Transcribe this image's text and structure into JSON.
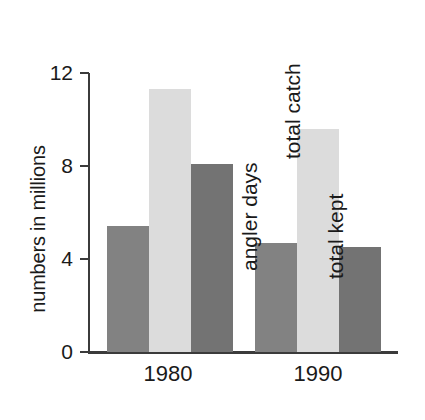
{
  "chart_data": {
    "type": "bar",
    "title": "",
    "subtitle": "",
    "xlabel": "",
    "ylabel": "numbers in millions",
    "categories": [
      "1980",
      "1990"
    ],
    "series": [
      {
        "name": "angler days",
        "values": [
          5.4,
          4.7
        ],
        "color": "#828282"
      },
      {
        "name": "total catch",
        "values": [
          11.3,
          9.6
        ],
        "color": "#dcdcdc"
      },
      {
        "name": "total kept",
        "values": [
          8.1,
          4.5
        ],
        "color": "#737373"
      }
    ],
    "ylim": [
      0,
      12
    ],
    "yticks": [
      "0",
      "4",
      "8",
      "12"
    ],
    "ytick_values": [
      0,
      4,
      8,
      12
    ],
    "grid": false,
    "legend": "in-plot rotated labels on 1990 group",
    "annotations": [
      "angler days",
      "total catch",
      "total kept"
    ]
  },
  "axis": {
    "y_title": "numbers in millions",
    "tick_12": "12",
    "tick_8": "8",
    "tick_4": "4",
    "tick_0": "0"
  },
  "groups": {
    "g0_label": "1980",
    "g1_label": "1990"
  },
  "annotations": {
    "angler_days": "angler days",
    "total_catch": "total catch",
    "total_kept": "total kept"
  }
}
